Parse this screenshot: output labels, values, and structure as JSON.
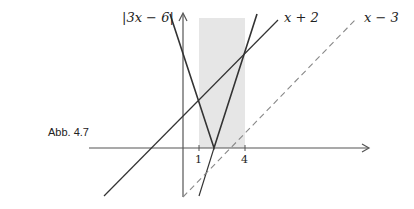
{
  "caption": "Abb. 4.7",
  "labels": {
    "abs": "|3x − 6|",
    "line1": "x + 2",
    "line2": "x − 3"
  },
  "ticks": [
    "1",
    "4"
  ],
  "colors": {
    "axis": "#555555",
    "curve": "#333333",
    "dashed": "#888888",
    "shade": "#e6e6e6"
  }
}
